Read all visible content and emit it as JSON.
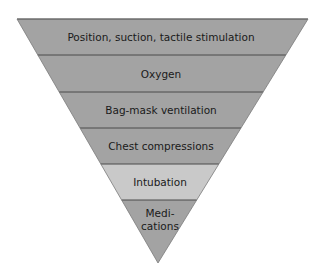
{
  "diagram": {
    "type": "inverted-pyramid",
    "colors": {
      "band_default": "#a3a3a3",
      "band_highlight": "#c9c9c9",
      "divider": "#4a4a4a",
      "text": "#1a1a1a"
    },
    "levels": [
      {
        "label": "Position, suction, tactile stimulation",
        "shade": "default"
      },
      {
        "label": "Oxygen",
        "shade": "default"
      },
      {
        "label": "Bag-mask ventilation",
        "shade": "default"
      },
      {
        "label": "Chest compressions",
        "shade": "default"
      },
      {
        "label": "Intubation",
        "shade": "highlight"
      },
      {
        "label_line1": "Medi-",
        "label_line2": "cations",
        "shade": "default"
      }
    ]
  }
}
